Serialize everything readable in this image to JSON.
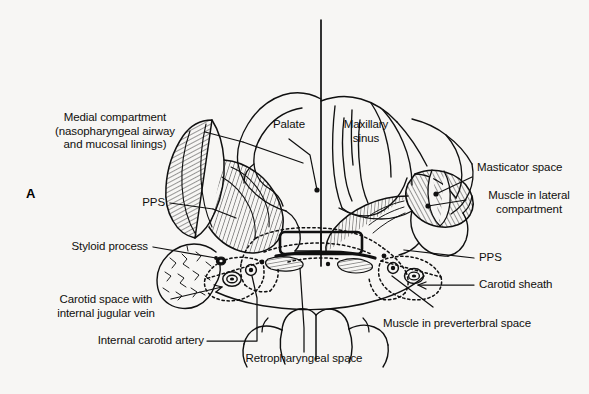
{
  "figure": {
    "panel_letter": "A",
    "background_color": "#f7f6f4",
    "ink_color": "#101010",
    "width": 589,
    "height": 394
  },
  "labels": {
    "medial_compartment": "Medial compartment\n(nasopharyngeal airway\nand mucosal linings)",
    "pps_left": "PPS",
    "styloid_process": "Styloid process",
    "carotid_space": "Carotid space with\ninternal jugular vein",
    "internal_carotid_artery": "Internal carotid artery",
    "retropharyngeal_space": "Retropharyngeal space",
    "palate": "Palate",
    "maxillary_sinus": "Maxillary\nsinus",
    "masticator_space": "Masticator space",
    "muscle_lateral_compartment": "Muscle in lateral\ncompartment",
    "pps_right": "PPS",
    "carotid_sheath": "Carotid sheath",
    "muscle_prevertebral_space": "Muscle in preverterbral space"
  }
}
